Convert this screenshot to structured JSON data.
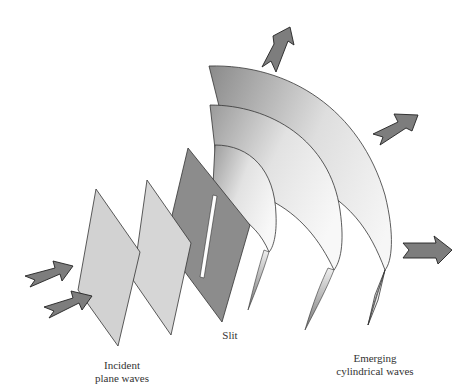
{
  "figure": {
    "labels": {
      "incident": [
        "Incident",
        "plane waves"
      ],
      "slit": "Slit",
      "emerging": [
        "Emerging",
        "cylindrical waves"
      ]
    },
    "colors": {
      "plane_fill": "#d4d4d4",
      "screen_fill": "#8c8c8c",
      "wave_dark": "#8a8a8a",
      "wave_light": "#f4f4f4",
      "arrow_fill": "#7d7d7d",
      "outline": "#333333",
      "background": "#ffffff"
    },
    "elements": {
      "incident_arrows": 2,
      "plane_wavefronts": 2,
      "slit_screens": 1,
      "cylindrical_wavefronts": 3,
      "outgoing_arrows": 3
    }
  }
}
